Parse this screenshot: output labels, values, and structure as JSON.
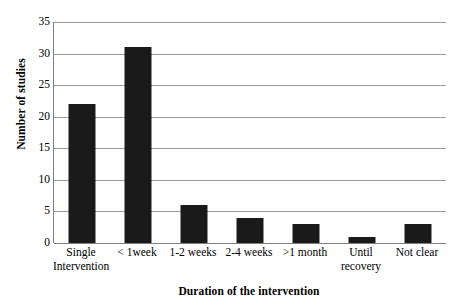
{
  "chart_data": {
    "type": "bar",
    "title": "",
    "xlabel": "Duration of the intervention",
    "ylabel": "Number of studies",
    "categories": [
      "Single\nIntervention",
      "< 1week",
      "1-2 weeks",
      "2-4 weeks",
      ">1 month",
      "Until\nrecovery",
      "Not clear"
    ],
    "values": [
      22,
      31,
      6,
      4,
      3,
      1,
      3
    ],
    "ylim": [
      0,
      35
    ],
    "ytick_labels": [
      "0",
      "5",
      "10",
      "15",
      "20",
      "25",
      "30",
      "35"
    ],
    "ytick_values": [
      0,
      5,
      10,
      15,
      20,
      25,
      30,
      35
    ],
    "grid": "horizontal",
    "legend": "none",
    "bar_color": "#1a1a1a",
    "gridline_color": "#9a9a9a",
    "axis_color": "#808080",
    "background_color": "#ffffff"
  }
}
